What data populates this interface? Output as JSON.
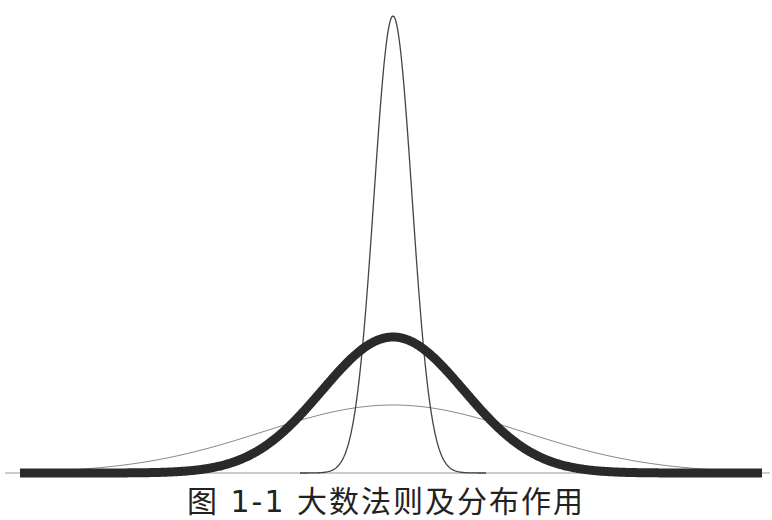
{
  "chart_data": {
    "type": "line",
    "title": "",
    "caption": "图 1-1  大数法则及分布作用",
    "xlabel": "",
    "ylabel": "",
    "axes": {
      "visible": false,
      "grid": false,
      "baseline": true
    },
    "legend": null,
    "x_range_px": [
      5,
      770
    ],
    "baseline_y_px": 473,
    "center_x_px": 393,
    "series": [
      {
        "name": "narrow-curve",
        "style": "thin",
        "color": "#444444",
        "stroke_width": 1.3,
        "peak_height_px": 457,
        "sigma_px": 19,
        "x_start_px": 300,
        "x_end_px": 486
      },
      {
        "name": "bold-curve",
        "style": "thick",
        "color": "#2a2a2a",
        "stroke_width": 9,
        "peak_height_px": 136,
        "sigma_px": 71,
        "x_start_px": 20,
        "x_end_px": 762
      },
      {
        "name": "wide-curve",
        "style": "hairline",
        "color": "#8a8a8a",
        "stroke_width": 1,
        "peak_height_px": 68,
        "sigma_px": 130,
        "x_start_px": 20,
        "x_end_px": 762
      }
    ]
  }
}
